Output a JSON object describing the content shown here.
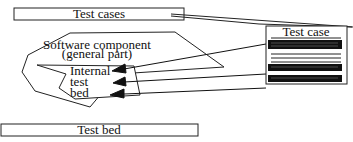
{
  "diagram": {
    "test_cases_box": {
      "label": "Test cases"
    },
    "software_component": {
      "line1": "Software component",
      "line2": "(general part)"
    },
    "internal_test_bed": {
      "line1": "Internal",
      "line2": "test",
      "line3": "bed"
    },
    "test_case_card": {
      "title": "Test case"
    },
    "test_bed_box": {
      "label": "Test bed"
    },
    "colors": {
      "stroke": "#222222",
      "fill": "#ffffff",
      "bar": "#111111"
    }
  }
}
